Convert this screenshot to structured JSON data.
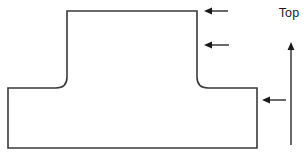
{
  "figure": {
    "type": "engineering-cross-section",
    "shape_name": "t-section-profile",
    "background_color": "#ffffff",
    "stroke_color": "#3a3a3a",
    "stroke_width": 1.6,
    "fill_color": "#ffffff"
  },
  "labels": {
    "top": "Top"
  },
  "geometry": {
    "web": {
      "left_x": 67,
      "right_x": 197,
      "top_y": 11,
      "junction_y": 88
    },
    "left_flange": {
      "left_x": 8,
      "right_x": 67,
      "top_y": 88,
      "bottom_y": 148
    },
    "right_flange": {
      "left_x": 197,
      "right_x": 257,
      "top_y": 88,
      "bottom_y": 148
    },
    "fillet_radius": 11,
    "outline_path": "M 67 11 L 197 11 L 197 77 Q 197 88 208 88 L 257 88 L 257 148 L 8 148 L 8 88 L 56 88 Q 67 88 67 77 Z"
  },
  "annotations": {
    "leader_arrows": [
      {
        "name": "leader-arrow-web-top",
        "direction": "left",
        "y": 11,
        "tip_x": 204,
        "tail_x": 228
      },
      {
        "name": "leader-arrow-web-side",
        "direction": "left",
        "y": 45,
        "tip_x": 204,
        "tail_x": 229
      },
      {
        "name": "leader-arrow-flange-side",
        "direction": "left",
        "y": 100,
        "tip_x": 262,
        "tail_x": 286
      }
    ],
    "orientation_arrow": {
      "name": "top-direction-arrow",
      "direction": "up",
      "x": 291,
      "tail_y": 145,
      "tip_y": 42
    }
  }
}
